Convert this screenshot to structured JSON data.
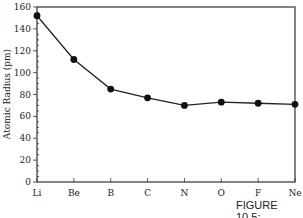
{
  "chart_data": {
    "type": "line",
    "title": "",
    "xlabel": "",
    "ylabel": "Atomic Radius (pm)",
    "categories": [
      "Li",
      "Be",
      "B",
      "C",
      "N",
      "O",
      "F",
      "Ne"
    ],
    "series": [
      {
        "name": "Atomic Radius",
        "values": [
          152,
          112,
          85,
          77,
          70,
          73,
          72,
          71
        ]
      }
    ],
    "ylim": [
      0,
      160
    ],
    "yticks": [
      0,
      20,
      40,
      60,
      80,
      100,
      120,
      140,
      160
    ],
    "y_minor_step": 5,
    "grid": false,
    "legend": null,
    "marker": "filled-circle",
    "line_color": "#222222",
    "caption": "FIGURE 10.5:"
  },
  "figure": {
    "caption": "FIGURE 10.5:"
  }
}
